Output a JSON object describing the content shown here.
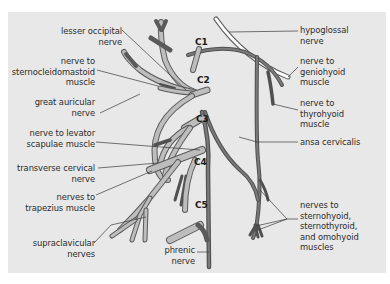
{
  "diagram": {
    "spinal_levels": [
      "C1",
      "C2",
      "C3",
      "C4",
      "C5"
    ],
    "labels_left": [
      {
        "id": "lesser-occipital",
        "text": "lesser occipital\nnerve"
      },
      {
        "id": "sternocleidomastoid",
        "text": "nerve to\nsternocleidomastoid\nmuscle"
      },
      {
        "id": "great-auricular",
        "text": "great auricular\nnerve"
      },
      {
        "id": "levator-scapulae",
        "text": "nerve to levator\nscapulae muscle"
      },
      {
        "id": "transverse-cervical",
        "text": "transverse cervical\nnerve"
      },
      {
        "id": "trapezius",
        "text": "nerves to\ntrapezius muscle"
      },
      {
        "id": "supraclavicular",
        "text": "supraclavicular\nnerves"
      }
    ],
    "labels_bottom": [
      {
        "id": "phrenic",
        "text": "phrenic\nnerve"
      }
    ],
    "labels_right": [
      {
        "id": "hypoglossal",
        "text": "hypoglossal\nnerve"
      },
      {
        "id": "geniohyoid",
        "text": "nerve to\ngeniohyoid\nmuscle"
      },
      {
        "id": "thyrohyoid",
        "text": "nerve to\nthyrohyoid\nmuscle"
      },
      {
        "id": "ansa-cervicalis",
        "text": "ansa cervicalis"
      },
      {
        "id": "infrahyoid",
        "text": "nerves to\nsternohyoid,\nsternothyroid,\nand omohyoid\nmuscles"
      }
    ],
    "colors": {
      "background": "#e8e8e8",
      "nerve_fill": "#b9b9b9",
      "nerve_outline": "#5a5a5a",
      "ansa_nerve": "#6f6f6f",
      "hypoglossal_fill": "#ffffff",
      "leader_line": "#3a3a3a",
      "text": "#2b2b2b"
    }
  }
}
